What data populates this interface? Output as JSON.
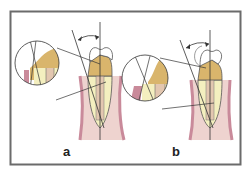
{
  "figure": {
    "panels": [
      {
        "id": "a",
        "label": "a"
      },
      {
        "id": "b",
        "label": "b"
      }
    ]
  },
  "colors": {
    "frame": "#6b6b6b",
    "enamel_crown": "#d9b56c",
    "dentin": "#f4efbf",
    "pulp": "#e3c7b0",
    "gingiva": "#c98a9a",
    "soft_tissue": "#eed3cf",
    "lines": "#333333"
  }
}
